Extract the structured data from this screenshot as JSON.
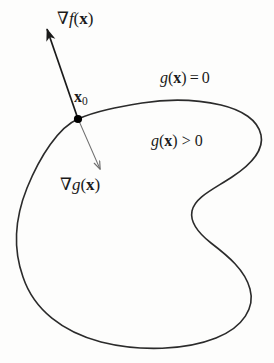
{
  "figure": {
    "name": "constrained-optimization-gradient-diagram",
    "width": 274,
    "height": 363,
    "background_color": "#fdfdfc",
    "curve_color": "#2b2b2b",
    "arrow_color": "#1a1a1a",
    "thin_arrow_color": "#6e6e6e",
    "point_color": "#000000"
  },
  "labels": {
    "gradient_f": {
      "nabla": "∇",
      "func": "f",
      "open": "(",
      "var": "x",
      "close": ")",
      "full_text": "∇f(x)"
    },
    "point": {
      "var": "x",
      "subscript": "0",
      "full_text": "x₀"
    },
    "gradient_g": {
      "nabla": "∇",
      "func": "g",
      "open": "(",
      "var": "x",
      "close": ")",
      "full_text": "∇g(x)"
    },
    "constraint_boundary": {
      "func": "g",
      "open": "(",
      "var": "x",
      "close": ")",
      "relation": "=",
      "value": "0",
      "full_text": "g(x) = 0"
    },
    "feasible_region": {
      "func": "g",
      "open": "(",
      "var": "x",
      "close": ")",
      "relation": ">",
      "value": "0",
      "full_text": "g(x) > 0"
    }
  },
  "geometry": {
    "point_x0": {
      "x": 78,
      "y": 119
    },
    "gradient_f_arrow": {
      "from_x": 78,
      "from_y": 119,
      "to_x": 45,
      "to_y": 24
    },
    "gradient_g_arrow": {
      "from_x": 79,
      "from_y": 121,
      "to_x": 101,
      "to_y": 173
    },
    "boundary_path": "M 78 119 C 60 126 40 155 26 188 C 14 217 13 248 22 276 C 33 309 62 331 100 341 C 140 351 185 349 215 337 C 243 326 254 307 250 289 C 246 270 228 256 211 243 C 197 232 190 221 192 211 C 195 198 213 190 231 178 C 251 165 263 150 261 136 C 259 121 243 110 222 105 C 196 99 168 99 143 103 C 119 107 96 111 78 119 Z"
  }
}
